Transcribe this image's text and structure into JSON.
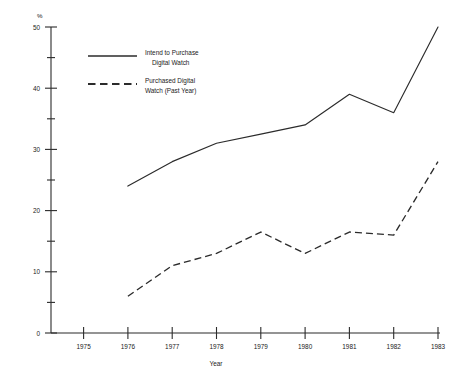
{
  "chart_data": {
    "type": "line",
    "title": "",
    "xlabel": "Year",
    "ylabel": "%",
    "x": [
      1976,
      1977,
      1978,
      1979,
      1980,
      1981,
      1982,
      1983
    ],
    "xlim": [
      1975,
      1983
    ],
    "ylim": [
      0,
      50
    ],
    "grid": false,
    "legend_position": "top-left inside plot",
    "x_tick_labels": [
      "1975",
      "1976",
      "1977",
      "1978",
      "1979",
      "1980",
      "1981",
      "1982",
      "1983"
    ],
    "y_tick_labels": [
      "0",
      "10",
      "20",
      "30",
      "40",
      "50"
    ],
    "y_minor_ticks": [
      5,
      15,
      25,
      35,
      45
    ],
    "series": [
      {
        "name": "Intend to Purchase Digital Watch",
        "style": "solid",
        "color": "#2b2b2b",
        "values": [
          24,
          28,
          31,
          32.5,
          34,
          39,
          36,
          50
        ]
      },
      {
        "name": "Purchased Digital Watch (Past Year)",
        "style": "dashed",
        "color": "#2b2b2b",
        "values": [
          6,
          11,
          13,
          16.5,
          13,
          16.5,
          16,
          28
        ]
      }
    ]
  },
  "axes": {
    "y_unit": "%",
    "x_title": "Year",
    "y_ticks": [
      {
        "label": "50",
        "value": 50
      },
      {
        "label": "40",
        "value": 40
      },
      {
        "label": "30",
        "value": 30
      },
      {
        "label": "20",
        "value": 20
      },
      {
        "label": "10",
        "value": 10
      },
      {
        "label": "0",
        "value": 0
      }
    ],
    "x_ticks": [
      {
        "label": "1975",
        "value": 1975
      },
      {
        "label": "1976",
        "value": 1976
      },
      {
        "label": "1977",
        "value": 1977
      },
      {
        "label": "1978",
        "value": 1978
      },
      {
        "label": "1979",
        "value": 1979
      },
      {
        "label": "1980",
        "value": 1980
      },
      {
        "label": "1981",
        "value": 1981
      },
      {
        "label": "1982",
        "value": 1982
      },
      {
        "label": "1983",
        "value": 1983
      }
    ]
  },
  "legend": {
    "entries": [
      {
        "line1": "Intend to Purchase",
        "line2": "Digital Watch",
        "style": "solid"
      },
      {
        "line1": "Purchased Digital",
        "line2": "Watch (Past Year)",
        "style": "dashed"
      }
    ]
  }
}
